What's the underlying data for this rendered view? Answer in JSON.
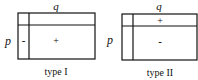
{
  "diagrams": [
    {
      "caption": "type I",
      "top_label": "q",
      "side_label": "p",
      "cell_left": "-",
      "cell_main": "+"
    },
    {
      "caption": "type II",
      "top_label": "q",
      "side_label": "p",
      "cell_top": "+",
      "cell_main": "-"
    }
  ]
}
